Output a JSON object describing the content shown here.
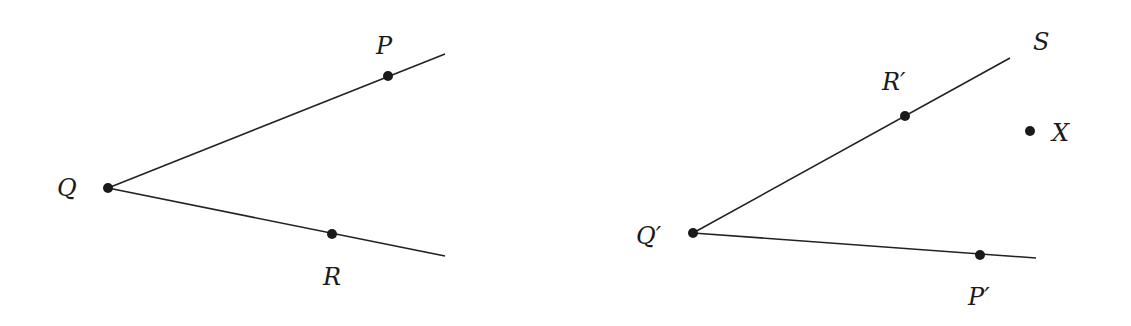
{
  "figure": {
    "left": {
      "vertex": {
        "label": "Q",
        "x": 108,
        "y": 188,
        "label_x": 57,
        "label_y": 196
      },
      "rays": [
        {
          "name": "ray-QP",
          "x1": 108,
          "y1": 188,
          "x2": 445,
          "y2": 54
        },
        {
          "name": "ray-QR",
          "x1": 108,
          "y1": 188,
          "x2": 445,
          "y2": 256
        }
      ],
      "points": [
        {
          "label": "P",
          "x": 388,
          "y": 76,
          "label_x": 376,
          "label_y": 54
        },
        {
          "label": "R",
          "x": 332,
          "y": 234,
          "label_x": 323,
          "label_y": 285
        }
      ]
    },
    "right": {
      "vertex": {
        "label": "Q′",
        "x": 693,
        "y": 233,
        "label_x": 636,
        "label_y": 244
      },
      "rays": [
        {
          "name": "ray-Q'S",
          "x1": 693,
          "y1": 233,
          "x2": 1010,
          "y2": 58
        },
        {
          "name": "ray-Q'P'",
          "x1": 693,
          "y1": 233,
          "x2": 1036,
          "y2": 258
        }
      ],
      "points": [
        {
          "label": "R′",
          "x": 905,
          "y": 116,
          "label_x": 882,
          "label_y": 90
        },
        {
          "label": "P′",
          "x": 980,
          "y": 255,
          "label_x": 968,
          "label_y": 305
        },
        {
          "label": "X",
          "x": 1030,
          "y": 131,
          "label_x": 1052,
          "label_y": 141
        }
      ],
      "ray_end_label": {
        "label": "S",
        "x": 1033,
        "y": 50
      }
    }
  }
}
